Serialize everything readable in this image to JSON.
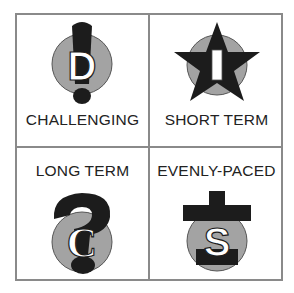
{
  "quadrants": [
    {
      "label": "CHALLENGING",
      "letter": "D",
      "icon": "exclamation-icon",
      "position": "top-left"
    },
    {
      "label": "SHORT TERM",
      "letter": "I",
      "icon": "star-icon",
      "position": "top-right"
    },
    {
      "label": "LONG TERM",
      "letter": "C",
      "icon": "question-icon",
      "position": "bottom-left"
    },
    {
      "label": "EVENLY-PACED",
      "letter": "S",
      "icon": "plus-icon",
      "position": "bottom-right"
    }
  ],
  "colors": {
    "circle": "#a3a3a3",
    "symbol": "#1c1c1c",
    "border": "#8a8a8a",
    "letter_fill": "#ffffff"
  }
}
